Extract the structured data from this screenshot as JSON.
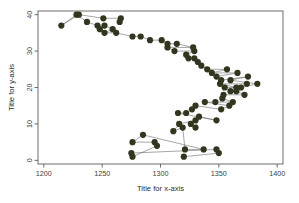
{
  "figure": {
    "background_color": "#ffffff",
    "plot_box": {
      "x0": 38,
      "y0": 11,
      "x1": 283,
      "y1": 164
    }
  },
  "chart_data": {
    "type": "scatter",
    "subtype": "connected-scatter",
    "title": "",
    "xlabel": "Title for x-axis",
    "ylabel": "Title for y-axis",
    "xlim": [
      1195,
      1405
    ],
    "ylim": [
      -1,
      41
    ],
    "xticks": [
      1200,
      1250,
      1300,
      1350,
      1400
    ],
    "yticks": [
      0,
      10,
      20,
      30,
      40
    ],
    "xtick_labels": [
      "1200",
      "1250",
      "1300",
      "1350",
      "1400"
    ],
    "ytick_labels": [
      "0",
      "10",
      "20",
      "30",
      "40"
    ],
    "grid": false,
    "legend": false,
    "legend_position": "none",
    "point_color": "#31361f",
    "line_color": "#6b6b6b",
    "point_size": 3.1,
    "marker": "filled-circle",
    "orientation": "y-is-index",
    "series": [
      {
        "name": "series-1",
        "connected": true,
        "x": [
          1320,
          1350,
          1348,
          1275,
          1276,
          1297,
          1295,
          1276,
          1285,
          1337,
          1321,
          1319,
          1311,
          1316,
          1330,
          1326,
          1330,
          1333,
          1348,
          1315,
          1322,
          1327,
          1330,
          1352,
          1359,
          1338,
          1347,
          1362,
          1353,
          1354,
          1372,
          1365,
          1360,
          1355,
          1365,
          1351,
          1374,
          1369,
          1383,
          1360,
          1375,
          1352,
          1348,
          1366,
          1344,
          1357,
          1340,
          1335,
          1332,
          1329,
          1324,
          1322,
          1329,
          1312,
          1306,
          1328,
          1314,
          1306,
          1301,
          1291,
          1283,
          1276,
          1262,
          1252,
          1259,
          1252,
          1248,
          1246,
          1237,
          1228,
          1215,
          1230,
          1251,
          1266,
          1265
        ],
        "y": [
          1,
          2,
          3,
          2,
          1,
          4,
          5,
          5,
          7,
          3,
          3,
          9,
          8,
          10,
          11,
          10,
          9,
          12,
          11,
          13,
          13,
          14,
          15,
          14,
          15,
          16,
          16,
          16,
          17,
          18,
          18,
          19,
          19,
          20,
          20,
          21,
          21,
          20,
          21,
          22,
          23,
          22,
          23,
          24,
          24,
          25,
          25,
          26,
          27,
          28,
          28,
          29,
          30,
          30,
          31,
          31,
          32,
          32,
          33,
          33,
          34,
          34,
          35,
          35,
          36,
          37,
          36,
          37,
          38,
          40,
          37,
          40,
          39,
          39,
          38
        ]
      }
    ]
  },
  "edge_text": {
    "lines": [
      "",
      "",
      "",
      "",
      ""
    ]
  }
}
